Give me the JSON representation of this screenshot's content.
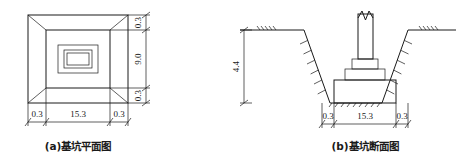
{
  "drawing": {
    "title_a": "(a)基坑平面图",
    "title_b": "(b)基坑断面图",
    "ink_color": "#1a1a1a",
    "background_color": "#ffffff"
  },
  "figure_a": {
    "name": "foundation-pit-plan-view",
    "caption": "(a)基坑平面图",
    "dimensions": {
      "bottom": [
        {
          "label": "0.3",
          "name": "plan-bottom-left-offset"
        },
        {
          "label": "15.3",
          "name": "plan-bottom-width"
        },
        {
          "label": "0.3",
          "name": "plan-bottom-right-offset"
        }
      ],
      "right": [
        {
          "label": "0.3",
          "name": "plan-right-top-offset"
        },
        {
          "label": "9.0",
          "name": "plan-right-height"
        },
        {
          "label": "0.3",
          "name": "plan-right-bottom-offset"
        }
      ]
    }
  },
  "figure_b": {
    "name": "foundation-pit-section-view",
    "caption": "(b)基坑断面图",
    "dimensions": {
      "left": [
        {
          "label": "4.4",
          "name": "section-depth"
        }
      ],
      "bottom": [
        {
          "label": "0.3",
          "name": "section-bottom-left-offset"
        },
        {
          "label": "15.3",
          "name": "section-bottom-width"
        },
        {
          "label": "0.3",
          "name": "section-bottom-right-offset"
        }
      ]
    }
  }
}
